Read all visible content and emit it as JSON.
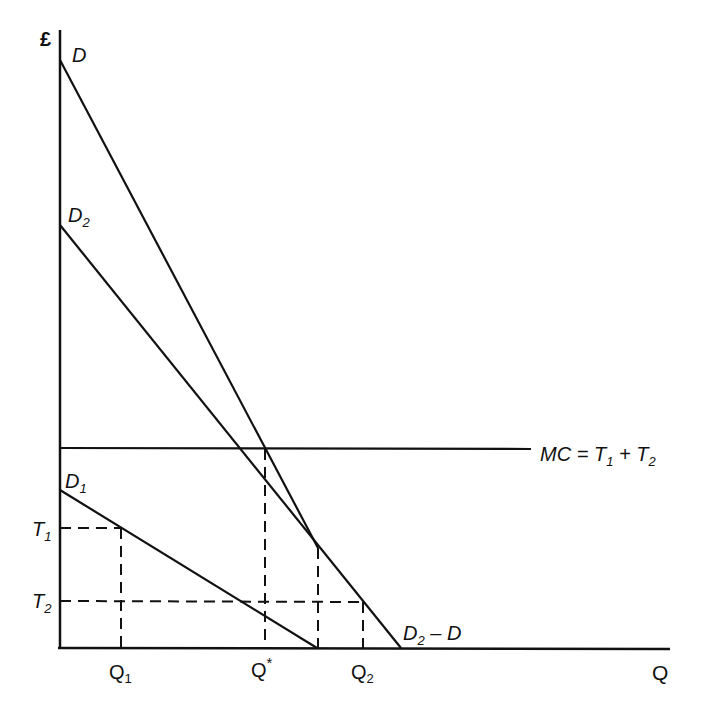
{
  "diagram": {
    "y_axis_label": "£",
    "x_axis_label": "Q",
    "curves": {
      "D": {
        "label": "D",
        "sub": ""
      },
      "D2": {
        "label": "D",
        "sub": "2"
      },
      "D1": {
        "label": "D",
        "sub": "1"
      },
      "D2_minus_D": {
        "label": "D",
        "sub": "2",
        "suffix": " – D"
      }
    },
    "mc_label": {
      "main": "MC = T",
      "sub1": "1",
      "plus": " + T",
      "sub2": "2"
    },
    "y_ticks": [
      {
        "label": "T",
        "sub": "1"
      },
      {
        "label": "T",
        "sub": "2"
      }
    ],
    "x_ticks": [
      {
        "label": "Q",
        "sub": "1"
      },
      {
        "label": "Q",
        "sup": "*"
      },
      {
        "label": "Q",
        "sub": "2"
      }
    ],
    "colors": {
      "line": "#111111",
      "background": "#ffffff"
    }
  }
}
